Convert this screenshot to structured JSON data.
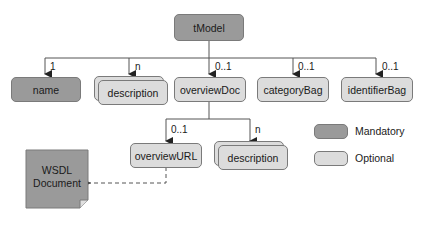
{
  "diagram": {
    "root": {
      "label": "tModel",
      "type": "mandatory"
    },
    "children": [
      {
        "label": "name",
        "type": "mandatory",
        "cardinality": "1",
        "multiple": false
      },
      {
        "label": "description",
        "type": "optional",
        "cardinality": "n",
        "multiple": true
      },
      {
        "label": "overviewDoc",
        "type": "optional",
        "cardinality": "0..1",
        "multiple": false
      },
      {
        "label": "categoryBag",
        "type": "optional",
        "cardinality": "0..1",
        "multiple": false
      },
      {
        "label": "identifierBag",
        "type": "optional",
        "cardinality": "0..1",
        "multiple": false
      }
    ],
    "overviewDoc_children": [
      {
        "label": "overviewURL",
        "type": "optional",
        "cardinality": "0..1",
        "multiple": false
      },
      {
        "label": "description",
        "type": "optional",
        "cardinality": "n",
        "multiple": true
      }
    ],
    "document": {
      "line1": "WSDL",
      "line2": "Document"
    },
    "legend": [
      {
        "label": "Mandatory",
        "color": "#9a9a9a"
      },
      {
        "label": "Optional",
        "color": "#dcdcdc"
      }
    ]
  }
}
